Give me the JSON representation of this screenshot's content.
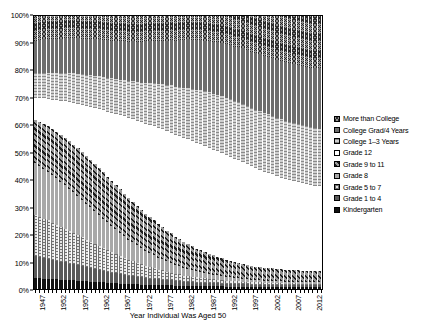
{
  "chart": {
    "type": "bar",
    "xlabel": "Year Individual Was Aged 50",
    "ylabel": "",
    "title": ""
  },
  "axes": {
    "y_ticks": [
      "0%",
      "10%",
      "20%",
      "30%",
      "40%",
      "50%",
      "60%",
      "70%",
      "80%",
      "90%",
      "100%"
    ],
    "y_min": 0,
    "y_max": 100,
    "x_tick_labels": [
      "1947",
      "1952",
      "1957",
      "1962",
      "1967",
      "1972",
      "1977",
      "1982",
      "1987",
      "1992",
      "1997",
      "2002",
      "2007",
      "2012"
    ],
    "x_title": "Year Individual Was Aged 50"
  },
  "legend": {
    "position": "right",
    "items": [
      {
        "label": "More than College",
        "pattern": "p-morecollege",
        "key": "more_than_college"
      },
      {
        "label": "College Grad/4 Years",
        "pattern": "p-collegegrad",
        "key": "college_grad_4_years"
      },
      {
        "label": "College 1–3 Years",
        "pattern": "p-college13",
        "key": "college_1_3_years"
      },
      {
        "label": "Grade 12",
        "pattern": "p-grade12",
        "key": "grade_12"
      },
      {
        "label": "Grade 9 to 11",
        "pattern": "p-grade911",
        "key": "grade_9_to_11"
      },
      {
        "label": "Grade 8",
        "pattern": "p-grade8",
        "key": "grade_8"
      },
      {
        "label": "Grade 5 to 7",
        "pattern": "p-grade57",
        "key": "grade_5_to_7"
      },
      {
        "label": "Grade 1 to 4",
        "pattern": "p-grade14",
        "key": "grade_1_to_4"
      },
      {
        "label": "Kindergarten",
        "pattern": "p-kindergarten",
        "key": "kindergarten"
      }
    ]
  },
  "chart_data": {
    "type": "bar",
    "stacked": true,
    "title": "",
    "xlabel": "Year Individual Was Aged 50",
    "ylabel": "",
    "ylim": [
      0,
      100
    ],
    "grid": false,
    "legend_position": "right",
    "categories": [
      1947,
      1948,
      1949,
      1950,
      1951,
      1952,
      1953,
      1954,
      1955,
      1956,
      1957,
      1958,
      1959,
      1960,
      1961,
      1962,
      1963,
      1964,
      1965,
      1966,
      1967,
      1968,
      1969,
      1970,
      1971,
      1972,
      1973,
      1974,
      1975,
      1976,
      1977,
      1978,
      1979,
      1980,
      1981,
      1982,
      1983,
      1984,
      1985,
      1986,
      1987,
      1988,
      1989,
      1990,
      1991,
      1992,
      1993,
      1994,
      1995,
      1996,
      1997,
      1998,
      1999,
      2000,
      2001,
      2002,
      2003,
      2004,
      2005,
      2006,
      2007,
      2008,
      2009,
      2010,
      2011,
      2012,
      2013,
      2014
    ],
    "stack_order_bottom_to_top": [
      "kindergarten",
      "grade_1_to_4",
      "grade_5_to_7",
      "grade_8",
      "grade_9_to_11",
      "grade_12",
      "college_1_3_years",
      "college_grad_4_years",
      "more_than_college"
    ],
    "series": [
      {
        "name": "Kindergarten",
        "key": "kindergarten",
        "values": [
          4.0,
          3.9,
          3.8,
          3.7,
          3.6,
          3.5,
          3.4,
          3.3,
          3.2,
          3.1,
          3.0,
          2.9,
          2.8,
          2.7,
          2.6,
          2.5,
          2.4,
          2.3,
          2.2,
          2.1,
          2.0,
          1.9,
          1.8,
          1.8,
          1.7,
          1.6,
          1.6,
          1.5,
          1.5,
          1.4,
          1.4,
          1.3,
          1.3,
          1.2,
          1.2,
          1.1,
          1.1,
          1.1,
          1.0,
          1.0,
          1.0,
          0.9,
          0.9,
          0.9,
          0.9,
          0.8,
          0.8,
          0.8,
          0.8,
          0.8,
          0.8,
          0.7,
          0.7,
          0.7,
          0.7,
          0.7,
          0.7,
          0.7,
          0.7,
          0.6,
          0.6,
          0.6,
          0.6,
          0.6,
          0.6,
          0.6,
          0.6,
          0.6
        ]
      },
      {
        "name": "Grade 1 to 4",
        "key": "grade_1_to_4",
        "values": [
          8.0,
          7.8,
          7.6,
          7.4,
          7.1,
          6.9,
          6.6,
          6.4,
          6.1,
          5.9,
          5.6,
          5.4,
          5.1,
          4.9,
          4.7,
          4.5,
          4.2,
          4.0,
          3.8,
          3.6,
          3.4,
          3.2,
          3.0,
          2.9,
          2.7,
          2.6,
          2.4,
          2.3,
          2.2,
          2.1,
          2.0,
          1.9,
          1.8,
          1.7,
          1.6,
          1.5,
          1.5,
          1.4,
          1.3,
          1.3,
          1.2,
          1.2,
          1.1,
          1.1,
          1.0,
          1.0,
          1.0,
          0.9,
          0.9,
          0.9,
          0.9,
          0.8,
          0.8,
          0.8,
          0.8,
          0.8,
          0.8,
          0.7,
          0.7,
          0.7,
          0.7,
          0.7,
          0.7,
          0.7,
          0.7,
          0.7,
          0.7,
          0.7
        ]
      },
      {
        "name": "Grade 5 to 7",
        "key": "grade_5_to_7",
        "values": [
          15.0,
          14.7,
          14.4,
          14.0,
          13.6,
          13.2,
          12.8,
          12.4,
          12.0,
          11.5,
          11.1,
          10.6,
          10.2,
          9.7,
          9.3,
          8.8,
          8.4,
          7.9,
          7.5,
          7.1,
          6.7,
          6.3,
          5.9,
          5.5,
          5.2,
          4.8,
          4.5,
          4.2,
          3.9,
          3.6,
          3.4,
          3.1,
          2.9,
          2.7,
          2.5,
          2.3,
          2.2,
          2.0,
          1.9,
          1.8,
          1.7,
          1.6,
          1.5,
          1.4,
          1.3,
          1.2,
          1.2,
          1.1,
          1.1,
          1.0,
          1.0,
          0.9,
          0.9,
          0.9,
          0.8,
          0.8,
          0.8,
          0.8,
          0.7,
          0.7,
          0.7,
          0.7,
          0.7,
          0.6,
          0.6,
          0.6,
          0.6,
          0.6
        ]
      },
      {
        "name": "Grade 8",
        "key": "grade_8",
        "values": [
          19.0,
          18.7,
          18.3,
          17.9,
          17.5,
          17.0,
          16.5,
          16.0,
          15.5,
          15.0,
          14.4,
          13.8,
          13.2,
          12.6,
          12.0,
          11.4,
          10.8,
          10.2,
          9.6,
          9.0,
          8.5,
          7.9,
          7.4,
          6.9,
          6.4,
          6.0,
          5.5,
          5.1,
          4.8,
          4.4,
          4.1,
          3.8,
          3.5,
          3.2,
          3.0,
          2.8,
          2.6,
          2.4,
          2.2,
          2.1,
          1.9,
          1.8,
          1.7,
          1.6,
          1.5,
          1.4,
          1.3,
          1.2,
          1.2,
          1.1,
          1.0,
          1.0,
          0.9,
          0.9,
          0.8,
          0.8,
          0.8,
          0.7,
          0.7,
          0.7,
          0.6,
          0.6,
          0.6,
          0.6,
          0.6,
          0.5,
          0.5,
          0.5
        ]
      },
      {
        "name": "Grade 9 to 11",
        "key": "grade_9_to_11",
        "values": [
          16.0,
          16.2,
          16.4,
          16.6,
          16.8,
          17.0,
          17.1,
          17.2,
          17.3,
          17.4,
          17.4,
          17.4,
          17.4,
          17.3,
          17.2,
          17.1,
          16.9,
          16.7,
          16.5,
          16.2,
          15.9,
          15.6,
          15.2,
          14.8,
          14.4,
          14.0,
          13.6,
          13.1,
          12.7,
          12.2,
          11.8,
          11.3,
          10.9,
          10.4,
          10.0,
          9.6,
          9.2,
          8.8,
          8.4,
          8.1,
          7.7,
          7.4,
          7.1,
          6.8,
          6.5,
          6.3,
          6.0,
          5.8,
          5.6,
          5.4,
          5.2,
          5.1,
          4.9,
          4.8,
          4.7,
          4.6,
          4.5,
          4.4,
          4.4,
          4.3,
          4.3,
          4.2,
          4.2,
          4.2,
          4.1,
          4.1,
          4.1,
          4.1
        ]
      },
      {
        "name": "Grade 12",
        "key": "grade_12",
        "values": [
          8.0,
          8.6,
          9.3,
          10.0,
          10.8,
          11.6,
          12.5,
          13.4,
          14.3,
          15.3,
          16.3,
          17.3,
          18.4,
          19.5,
          20.6,
          21.7,
          22.8,
          23.9,
          25.0,
          26.1,
          27.2,
          28.3,
          29.3,
          30.3,
          31.2,
          32.1,
          33.0,
          33.8,
          34.5,
          35.2,
          35.8,
          36.4,
          36.9,
          37.3,
          37.7,
          38.0,
          38.3,
          38.5,
          38.6,
          38.7,
          38.8,
          38.8,
          38.7,
          38.6,
          38.5,
          38.3,
          38.1,
          37.8,
          37.5,
          37.2,
          36.8,
          36.4,
          36.0,
          35.6,
          35.2,
          34.8,
          34.4,
          34.0,
          33.6,
          33.2,
          32.9,
          32.6,
          32.3,
          32.0,
          31.7,
          31.5,
          31.3,
          31.1
        ]
      },
      {
        "name": "College 1–3 Years",
        "key": "college_1_3_years",
        "values": [
          9.0,
          9.2,
          9.4,
          9.6,
          9.8,
          10.0,
          10.2,
          10.4,
          10.6,
          10.8,
          11.0,
          11.2,
          11.4,
          11.6,
          11.8,
          12.0,
          12.2,
          12.4,
          12.6,
          12.8,
          13.0,
          13.3,
          13.6,
          13.9,
          14.2,
          14.5,
          14.9,
          15.3,
          15.7,
          16.1,
          16.5,
          16.9,
          17.3,
          17.7,
          18.1,
          18.5,
          18.9,
          19.2,
          19.5,
          19.8,
          20.1,
          20.3,
          20.5,
          20.7,
          20.9,
          21.0,
          21.1,
          21.2,
          21.3,
          21.4,
          21.4,
          21.5,
          21.5,
          21.5,
          21.5,
          21.5,
          21.5,
          21.5,
          21.5,
          21.5,
          21.5,
          21.4,
          21.4,
          21.3,
          21.3,
          21.2,
          21.2,
          21.1
        ]
      },
      {
        "name": "College Grad/4 Years",
        "key": "college_grad_4_years",
        "values": [
          12.0,
          12.1,
          12.2,
          12.3,
          12.4,
          12.5,
          12.6,
          12.7,
          12.8,
          12.9,
          13.0,
          13.1,
          13.2,
          13.3,
          13.4,
          13.5,
          13.6,
          13.7,
          13.8,
          13.9,
          14.0,
          14.2,
          14.4,
          14.6,
          14.8,
          15.0,
          15.2,
          15.4,
          15.6,
          15.9,
          16.1,
          16.4,
          16.6,
          16.9,
          17.1,
          17.4,
          17.6,
          17.9,
          18.1,
          18.4,
          18.6,
          18.8,
          19.0,
          19.2,
          19.4,
          19.6,
          19.8,
          20.0,
          20.1,
          20.3,
          20.4,
          20.5,
          20.6,
          20.7,
          20.8,
          20.9,
          21.0,
          21.1,
          21.2,
          21.3,
          21.4,
          21.5,
          21.6,
          21.7,
          21.8,
          21.9,
          22.0,
          22.1
        ]
      },
      {
        "name": "More than College",
        "key": "more_than_college",
        "values": [
          9.0,
          8.8,
          8.6,
          8.5,
          8.4,
          8.3,
          8.3,
          8.2,
          8.2,
          8.1,
          8.2,
          8.3,
          8.3,
          8.4,
          8.4,
          8.5,
          8.7,
          8.9,
          9.0,
          9.2,
          9.3,
          9.3,
          9.4,
          9.3,
          9.4,
          9.4,
          9.3,
          9.3,
          9.1,
          9.1,
          9.0,
          9.0,
          8.8,
          9.0,
          8.8,
          8.8,
          8.6,
          8.7,
          8.9,
          8.8,
          9.0,
          9.2,
          9.5,
          9.7,
          10.0,
          10.4,
          10.7,
          11.2,
          11.5,
          11.9,
          12.5,
          13.1,
          13.7,
          14.1,
          14.7,
          15.1,
          15.5,
          16.1,
          16.5,
          17.0,
          17.3,
          17.7,
          18.0,
          18.3,
          18.6,
          18.9,
          19.0,
          19.2
        ]
      }
    ]
  }
}
